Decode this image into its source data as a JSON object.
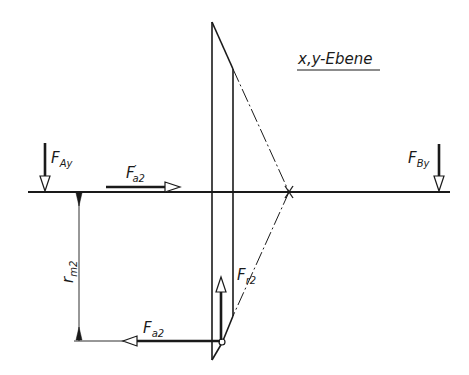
{
  "diagram": {
    "title": "x,y-Ebene",
    "colors": {
      "line": "#1a1a1a",
      "background": "#ffffff"
    },
    "forces": {
      "F_Ay": {
        "main": "F",
        "sub": "Ay",
        "direction": "down"
      },
      "F_a2_prime": {
        "main": "F",
        "prime": "′",
        "sub": "a2",
        "direction": "right"
      },
      "F_By": {
        "main": "F",
        "sub": "By",
        "direction": "down"
      },
      "F_a2": {
        "main": "F",
        "sub": "a2",
        "direction": "left"
      },
      "F_r2": {
        "main": "F",
        "sub": "r2",
        "direction": "up"
      }
    },
    "dimension": {
      "main": "r",
      "sub": "m2"
    }
  }
}
